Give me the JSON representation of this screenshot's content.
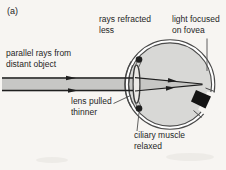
{
  "labels": {
    "panel": "(a)",
    "parallel_rays": "parallel rays from\ndistant object",
    "rays_refracted": "rays refracted\nless",
    "light_focused": "light focused\non fovea",
    "lens_pulled": "lens pulled\nthinner",
    "ciliary_muscle": "ciliary muscle\nrelaxed"
  },
  "colors": {
    "background": "#f7f5f2",
    "beam": "#c7c7c5",
    "eye_interior": "#d8d8d6",
    "outline": "#4a4a4a",
    "ink": "#1f1f1f",
    "optic_nerve": "#141414"
  }
}
